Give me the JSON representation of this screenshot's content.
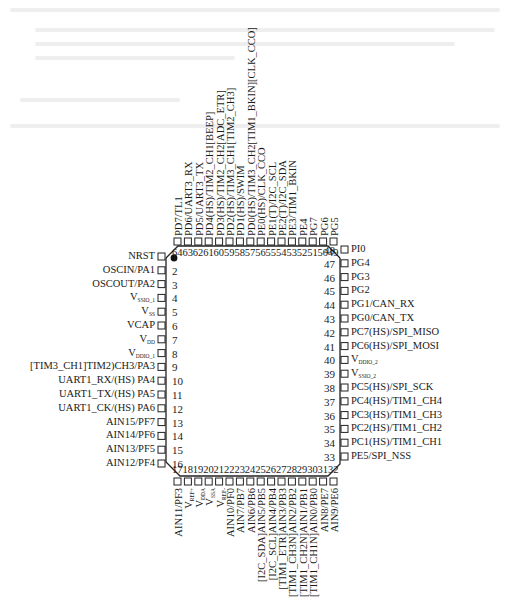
{
  "diagram": {
    "type": "pinout",
    "package_pins": 64,
    "pin1_marker": "filled-dot",
    "left_pins": [
      {
        "num": "1",
        "label": "NRST"
      },
      {
        "num": "2",
        "label": "OSCIN/PA1"
      },
      {
        "num": "3",
        "label": "OSCOUT/PA2"
      },
      {
        "num": "4",
        "label": "V",
        "sub": "SSIO_1"
      },
      {
        "num": "5",
        "label": "V",
        "sub": "SS"
      },
      {
        "num": "6",
        "label": "VCAP"
      },
      {
        "num": "7",
        "label": "V",
        "sub": "DD"
      },
      {
        "num": "8",
        "label": "V",
        "sub": "DDIO_1"
      },
      {
        "num": "9",
        "label": "[TIM3_CH1]TIM2)CH3/PA3"
      },
      {
        "num": "10",
        "label": "UART1_RX/(HS) PA4"
      },
      {
        "num": "11",
        "label": "UART1_TX/(HS) PA5"
      },
      {
        "num": "12",
        "label": "UART1_CK/(HS) PA6"
      },
      {
        "num": "13",
        "label": "AIN15/PF7"
      },
      {
        "num": "14",
        "label": "AIN14/PF6"
      },
      {
        "num": "15",
        "label": "AIN13/PF5"
      },
      {
        "num": "16",
        "label": "AIN12/PF4"
      }
    ],
    "bottom_pins": [
      {
        "num": "17",
        "label": "AIN11/PF3"
      },
      {
        "num": "18",
        "label": "V",
        "sub": "REF+"
      },
      {
        "num": "19",
        "label": "V",
        "sub": "DDA"
      },
      {
        "num": "20",
        "label": "V",
        "sub": "SSA"
      },
      {
        "num": "21",
        "label": "V",
        "sub": "REF-"
      },
      {
        "num": "22",
        "label": "AIN10/PF0"
      },
      {
        "num": "23",
        "label": "AIN7/PB7"
      },
      {
        "num": "24",
        "label": "AIN6/PB6"
      },
      {
        "num": "25",
        "label": "[I2C_SDA]AIN5/PB5"
      },
      {
        "num": "26",
        "label": "[I2C_SCL]AIN4/PB4"
      },
      {
        "num": "27",
        "label": "[TIM1_ETR]AIN3/PB3"
      },
      {
        "num": "28",
        "label": "[TIM1_CH3N]AIN2/PB2"
      },
      {
        "num": "29",
        "label": "[TIM1_CH2N]AIN1/PB1"
      },
      {
        "num": "30",
        "label": "[TIM1_CH1N]AIN0/PB0"
      },
      {
        "num": "31",
        "label": "AIN8/PE7"
      },
      {
        "num": "32",
        "label": "AIN9/PE6"
      }
    ],
    "right_pins": [
      {
        "num": "33",
        "label": "PE5/SPI_NSS"
      },
      {
        "num": "34",
        "label": "PC1(HS)/TIM1_CH1"
      },
      {
        "num": "35",
        "label": "PC2(HS)/TIM1_CH2"
      },
      {
        "num": "36",
        "label": "PC3(HS)/TIM1_CH3"
      },
      {
        "num": "37",
        "label": "PC4(HS)/TIM1_CH4"
      },
      {
        "num": "38",
        "label": "PC5(HS)/SPI_SCK"
      },
      {
        "num": "39",
        "label": "V",
        "sub": "SSIO_2"
      },
      {
        "num": "40",
        "label": "V",
        "sub": "DDIO_2"
      },
      {
        "num": "41",
        "label": "PC6(HS)/SPI_MOSI"
      },
      {
        "num": "42",
        "label": "PC7(HS)/SPI_MISO"
      },
      {
        "num": "43",
        "label": "PG0/CAN_TX"
      },
      {
        "num": "44",
        "label": "PG1/CAN_RX"
      },
      {
        "num": "45",
        "label": "PG2"
      },
      {
        "num": "46",
        "label": "PG3"
      },
      {
        "num": "47",
        "label": "PG4"
      },
      {
        "num": "48",
        "label": "PI0"
      }
    ],
    "top_pins": [
      {
        "num": "49",
        "label": "PG5"
      },
      {
        "num": "50",
        "label": "PG6"
      },
      {
        "num": "51",
        "label": "PG7"
      },
      {
        "num": "52",
        "label": "PE4"
      },
      {
        "num": "53",
        "label": "PE3/TIM1_BKIN"
      },
      {
        "num": "54",
        "label": "PE2(T)/I2C_SDA"
      },
      {
        "num": "55",
        "label": "PE1(T)/I2C_SCL"
      },
      {
        "num": "56",
        "label": "PE0(HS)/CLK_CCO"
      },
      {
        "num": "57",
        "label": "PD0(HS)/TIM3_CH2[TIM1_BKIN][CLK_CCO]"
      },
      {
        "num": "58",
        "label": "PD1(HS)/SWIM"
      },
      {
        "num": "59",
        "label": "PD2(HS)/TIM3_CH1[TIM2_CH3]"
      },
      {
        "num": "60",
        "label": "PD3(HS)/TIM2_CH2[ADC_ETR]"
      },
      {
        "num": "61",
        "label": "PD4(HS)/TIM2_CH1[BEEP]"
      },
      {
        "num": "62",
        "label": "PD5/UART3_TX"
      },
      {
        "num": "63",
        "label": "PD6/UART3_RX"
      },
      {
        "num": "64",
        "label": "PD7/TL1"
      }
    ]
  }
}
